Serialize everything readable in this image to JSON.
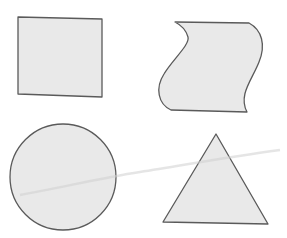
{
  "diagram": {
    "title": "",
    "shapes": [
      {
        "name": "square",
        "position": "top-left",
        "fill": "#e9e9e9",
        "stroke": "#5a5a5a"
      },
      {
        "name": "wave",
        "position": "top-right",
        "fill": "#e9e9e9",
        "stroke": "#5a5a5a"
      },
      {
        "name": "circle",
        "position": "bottom-left",
        "fill": "#e9e9e9",
        "stroke": "#5a5a5a"
      },
      {
        "name": "triangle",
        "position": "bottom-right",
        "fill": "#e9e9e9",
        "stroke": "#5a5a5a"
      }
    ],
    "background": "#ffffff"
  }
}
